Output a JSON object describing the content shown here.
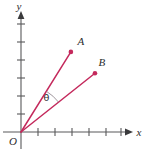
{
  "figure": {
    "background_color": "#ffffff",
    "axis_color": "#58585a",
    "ray_color": "#c4295c",
    "label_color": "#2b2b2d",
    "labels": {
      "y_axis": "y",
      "x_axis": "x",
      "origin": "O",
      "point_a": "A",
      "point_b": "B",
      "angle": "θ"
    }
  },
  "chart_data": {
    "type": "scatter",
    "xlabel": "x",
    "ylabel": "y",
    "grid": false,
    "legend": "none",
    "xlim": [
      0,
      7
    ],
    "ylim": [
      0,
      7
    ],
    "x_tick_labels": [
      "",
      "",
      "",
      "",
      "",
      ""
    ],
    "y_tick_labels": [
      "",
      "",
      "",
      "",
      "",
      ""
    ],
    "x_tick_count": 6,
    "y_tick_count": 6,
    "origin_label": "O",
    "points": [
      {
        "name": "A",
        "x": 2.9,
        "y": 4.5,
        "label": "A"
      },
      {
        "name": "B",
        "x": 4.3,
        "y": 3.3,
        "label": "B"
      }
    ],
    "rays": [
      {
        "name": "OA",
        "from": [
          0,
          0
        ],
        "to": [
          2.9,
          4.5
        ],
        "color": "#c4295c"
      },
      {
        "name": "OB",
        "from": [
          0,
          0
        ],
        "to": [
          4.3,
          3.3
        ],
        "color": "#c4295c"
      }
    ],
    "annotations": [
      {
        "name": "angle-theta",
        "text": "θ",
        "between": [
          "OA",
          "OB"
        ],
        "x": 1.75,
        "y": 2.4,
        "arc": true
      }
    ]
  }
}
